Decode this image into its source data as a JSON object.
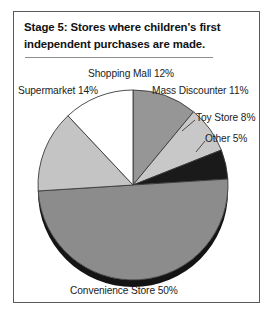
{
  "figure": {
    "title_line_1": "Stage 5: Stores where children's first",
    "title_line_2": "independent purchases are made."
  },
  "labels": {
    "shopping_mall": "Shopping Mall 12%",
    "supermarket": "Supermarket 14%",
    "mass_discounter": "Mass Discounter 11%",
    "toy_store": "Toy Store 8%",
    "other": "Other 5%",
    "convenience_store": "Convenience Store 50%"
  },
  "colors": {
    "mass_discounter": "#969696",
    "toy_store": "#c8c8c8",
    "other": "#1a1a1a",
    "convenience_store": "#8c8c8c",
    "supermarket": "#c4c4c4",
    "shopping_mall": "#ffffff",
    "outline": "#3a3a3a",
    "depth_edge": "#141414",
    "frame": "#5a5a5a",
    "text": "#1c1c1c"
  },
  "chart_data": {
    "type": "pie",
    "title": "Stage 5: Stores where children's first independent purchases are made.",
    "xlabel": "",
    "ylabel": "",
    "legend_position": "none",
    "grid": false,
    "units": "percent",
    "total": 100,
    "start_angle_deg": 0,
    "direction": "clockwise",
    "categories": [
      "Mass Discounter",
      "Toy Store",
      "Other",
      "Convenience Store",
      "Supermarket",
      "Shopping Mall"
    ],
    "values": [
      11,
      8,
      5,
      50,
      14,
      12
    ],
    "slices": [
      {
        "label": "Mass Discounter 11%",
        "name": "Mass Discounter",
        "value": 11,
        "color": "#969696"
      },
      {
        "label": "Toy Store 8%",
        "name": "Toy Store",
        "value": 8,
        "color": "#c8c8c8"
      },
      {
        "label": "Other 5%",
        "name": "Other",
        "value": 5,
        "color": "#1a1a1a"
      },
      {
        "label": "Convenience Store 50%",
        "name": "Convenience Store",
        "value": 50,
        "color": "#8c8c8c"
      },
      {
        "label": "Supermarket 14%",
        "name": "Supermarket",
        "value": 14,
        "color": "#c4c4c4"
      },
      {
        "label": "Shopping Mall 12%",
        "name": "Shopping Mall",
        "value": 12,
        "color": "#ffffff"
      }
    ]
  }
}
